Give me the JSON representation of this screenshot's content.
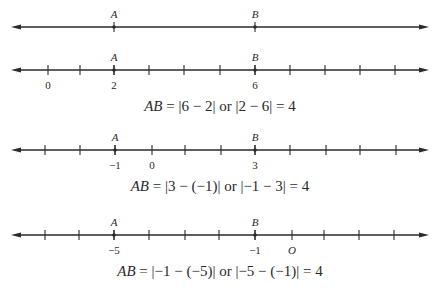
{
  "lines": [
    {
      "y": 27,
      "ticks": [],
      "points": [
        {
          "label": "A",
          "x": 114
        },
        {
          "label": "B",
          "x": 255
        }
      ],
      "numbers": []
    },
    {
      "y": 70,
      "ticks": [
        48,
        80,
        114,
        149,
        184,
        220,
        255,
        290,
        325,
        360,
        395
      ],
      "points": [
        {
          "label": "A",
          "x": 114
        },
        {
          "label": "B",
          "x": 255
        }
      ],
      "numbers": [
        {
          "label": "0",
          "x": 48,
          "italic": false
        },
        {
          "label": "2",
          "x": 114,
          "italic": false
        },
        {
          "label": "6",
          "x": 255,
          "italic": false
        }
      ]
    },
    {
      "y": 150,
      "ticks": [
        45,
        80,
        115,
        152,
        185,
        221,
        255,
        290,
        326,
        360,
        396
      ],
      "points": [
        {
          "label": "A",
          "x": 115
        },
        {
          "label": "B",
          "x": 255
        }
      ],
      "numbers": [
        {
          "label": "−1",
          "x": 115,
          "italic": false
        },
        {
          "label": "0",
          "x": 152,
          "italic": false
        },
        {
          "label": "3",
          "x": 255,
          "italic": false
        }
      ]
    },
    {
      "y": 235,
      "ticks": [
        45,
        79,
        114,
        149,
        185,
        219,
        255,
        292,
        324,
        359,
        394
      ],
      "points": [
        {
          "label": "A",
          "x": 114
        },
        {
          "label": "B",
          "x": 255
        }
      ],
      "numbers": [
        {
          "label": "−5",
          "x": 114,
          "italic": false
        },
        {
          "label": "−1",
          "x": 255,
          "italic": false
        },
        {
          "label": "O",
          "x": 292,
          "italic": true
        }
      ]
    }
  ],
  "equations": [
    {
      "top": 98,
      "lhs": "AB",
      "rhs": " = |6 − 2| or |2 − 6| = 4"
    },
    {
      "top": 178,
      "lhs": "AB",
      "rhs": " = |3 − (−1)| or |−1 − 3| = 4"
    },
    {
      "top": 263,
      "lhs": "AB",
      "rhs": " = |−1 − (−5)| or |−5 − (−1)| = 4"
    }
  ],
  "style": {
    "line_color": "#2a2a2a",
    "arrow_left_x": 11,
    "arrow_right_x": 429
  }
}
